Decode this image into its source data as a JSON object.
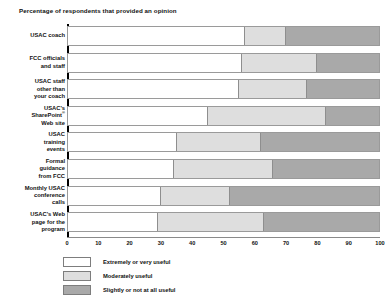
{
  "chart_data": {
    "type": "bar",
    "orientation": "horizontal",
    "stacked": true,
    "title": "Percentage of respondents that provided an opinion",
    "xlabel": "",
    "ylabel": "",
    "xlim": [
      0,
      100
    ],
    "xticks": [
      0,
      10,
      20,
      30,
      40,
      50,
      60,
      70,
      80,
      90,
      100
    ],
    "grid": false,
    "legend_position": "bottom-left",
    "categories": [
      "USAC coach",
      "FCC officials and staff",
      "USAC staff other than your coach",
      "USAC's SharePoint® Web site",
      "USAC training events",
      "Formal guidance from FCC",
      "Monthly USAC conference calls",
      "USAC's Web page for the program"
    ],
    "series": [
      {
        "name": "Extremely or very useful",
        "color": "#ffffff",
        "values": [
          57,
          56,
          55,
          45,
          35,
          34,
          30,
          29
        ]
      },
      {
        "name": "Moderately useful",
        "color": "#dedede",
        "values": [
          13,
          24,
          22,
          38,
          27,
          32,
          22,
          34
        ]
      },
      {
        "name": "Slightly or not at all useful",
        "color": "#a9a9a9",
        "values": [
          30,
          20,
          23,
          17,
          38,
          34,
          48,
          37
        ]
      }
    ],
    "cumulative_boundaries": [
      [
        57,
        70
      ],
      [
        56,
        80
      ],
      [
        55,
        77
      ],
      [
        45,
        83
      ],
      [
        35,
        62
      ],
      [
        34,
        66
      ],
      [
        30,
        52
      ],
      [
        29,
        63
      ]
    ]
  },
  "category_labels_html": [
    "USAC coach",
    "FCC officials<br>and staff",
    "USAC staff<br>other than<br>your coach",
    "USAC's<br>SharePoint<sup>&reg;</sup><br>Web site",
    "USAC<br>training<br>events",
    "Formal<br>guidance<br>from FCC",
    "Monthly USAC<br>conference<br>calls",
    "USAC's Web<br>page for the<br>program"
  ]
}
